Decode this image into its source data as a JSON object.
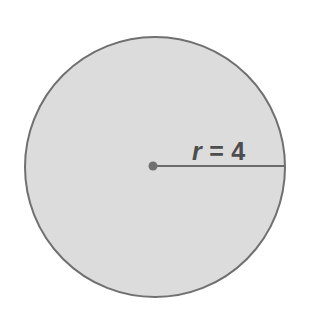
{
  "figure": {
    "type": "geometry-diagram",
    "shape": "circle",
    "background_color": "#ffffff",
    "caption_text": "r = 4",
    "label": {
      "variable": "r",
      "equals": "=",
      "value": "4",
      "full_text": "r = 4",
      "color": "#4d4d4d"
    },
    "circle": {
      "center_x": 155,
      "center_y": 167,
      "radius": 130,
      "fill_color": "#dcdcdc",
      "stroke_color": "#707070",
      "stroke_width": 2
    },
    "center_point": {
      "x": 153,
      "y": 166,
      "radius": 4.5,
      "color": "#707070"
    },
    "radius_line": {
      "x1": 153,
      "y1": 166,
      "x2": 285,
      "y2": 166,
      "color": "#6b6b6b",
      "width": 2
    }
  }
}
